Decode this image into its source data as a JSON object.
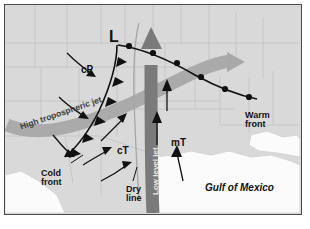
{
  "figure": {
    "frame_color": "#4a4a4a",
    "land_color": "#d9d9d9",
    "water_color": "#fbfbfb",
    "state_border_color": "#c2c2c2"
  },
  "labels": {
    "low_center": "L",
    "air_mass_cp": "cP",
    "air_mass_ct": "cT",
    "air_mass_mt": "mT",
    "cold_front": "Cold\nfront",
    "warm_front": "Warm\nfront",
    "dry_line": "Dry\nline",
    "jet_high": "High tropospheric jet",
    "jet_low": "Low level jet",
    "gulf": "Gulf of Mexico"
  },
  "features": {
    "high_jet": {
      "name": "High tropospheric jet",
      "color": "#a8a8a8",
      "description": "Broad gray ribbon sweeping from southwest to northeast, ending in an arrowhead over the east"
    },
    "low_jet": {
      "name": "Low level jet",
      "color": "#7a7a7a",
      "description": "Dark gray arrow flowing north from the Gulf of Mexico toward the low center"
    },
    "cold_front": {
      "name": "Cold front",
      "color": "#111111",
      "symbol": "triangles",
      "symbol_count": 6,
      "description": "Black line with triangular barbs trailing southwest from the low"
    },
    "warm_front": {
      "name": "Warm front",
      "color": "#111111",
      "symbol": "semicircles",
      "symbol_count": 6,
      "description": "Black line with semicircular bumps extending east-southeast from the low"
    },
    "dry_line": {
      "name": "Dry line",
      "color": "#9a9a9a",
      "description": "Thin pale curve running north-south just west of the low level jet"
    },
    "low_pressure": {
      "name": "Low pressure center",
      "marker": "L"
    }
  },
  "flow_arrows": [
    {
      "name": "cp-arrow-north",
      "region": "cP"
    },
    {
      "name": "cp-arrow-south",
      "region": "cP"
    },
    {
      "name": "cold-air-arrow-west",
      "region": "cP"
    },
    {
      "name": "ct-arrow-upper",
      "region": "cT"
    },
    {
      "name": "ct-arrow-lower",
      "region": "cT"
    },
    {
      "name": "ct-arrow-bottom",
      "region": "cT"
    },
    {
      "name": "mt-arrow-north",
      "region": "mT"
    },
    {
      "name": "mt-arrow-mid",
      "region": "mT"
    },
    {
      "name": "mt-arrow-gulf",
      "region": "mT"
    }
  ]
}
